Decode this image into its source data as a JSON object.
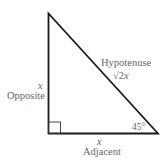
{
  "diagram": {
    "type": "right-triangle",
    "angle_marked": "45°",
    "right_angle_marker": true,
    "sides": {
      "opposite": {
        "label": "Opposite",
        "length": "x"
      },
      "adjacent": {
        "label": "Adjacent",
        "length": "x"
      },
      "hypotenuse": {
        "label": "Hypotenuse",
        "length_root": "√2",
        "length_var": "x"
      }
    }
  }
}
